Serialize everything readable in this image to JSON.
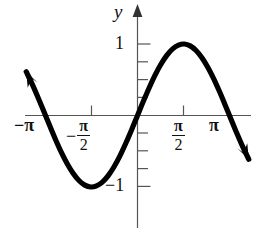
{
  "figure": {
    "kind": "math-graph",
    "axis_color": "#555555",
    "curve_color": "#000000",
    "background": "#ffffff",
    "y_axis_label": "y"
  },
  "labels": {
    "y_axis": "y",
    "y_tick_one": "1",
    "y_tick_neg_one": "−1",
    "x_tick_neg_pi": "−π",
    "x_tick_pi": "π",
    "minus_sign": "−",
    "pi_symbol": "π",
    "two": "2"
  },
  "chart_data": {
    "type": "line",
    "title": "",
    "xlabel": "",
    "ylabel": "y",
    "function": "y = sin(x)",
    "xlim": [
      -3.927,
      3.927
    ],
    "ylim": [
      -1.35,
      1.35
    ],
    "grid": false,
    "legend": null,
    "x_tick_labels": [
      "−π",
      "−π/2",
      "π/2",
      "π"
    ],
    "x_tick_values": [
      -3.14159,
      -1.5708,
      1.5708,
      3.14159
    ],
    "y_tick_labels": [
      "1",
      "−1"
    ],
    "y_tick_values": [
      1,
      -1
    ],
    "y_minor_tick_values": [
      0.75,
      0.5,
      0.25,
      -0.25,
      -0.5,
      -0.75
    ],
    "x": [
      -3.8,
      -3.6,
      -3.4,
      -3.2,
      -3.0,
      -2.8,
      -2.6,
      -2.4,
      -2.2,
      -2.0,
      -1.8,
      -1.6,
      -1.4,
      -1.2,
      -1.0,
      -0.8,
      -0.6,
      -0.4,
      -0.2,
      0.0,
      0.2,
      0.4,
      0.6,
      0.8,
      1.0,
      1.2,
      1.4,
      1.6,
      1.8,
      2.0,
      2.2,
      2.4,
      2.6,
      2.8,
      3.0,
      3.2,
      3.4,
      3.6,
      3.8
    ],
    "y": [
      0.612,
      0.443,
      0.256,
      0.058,
      -0.141,
      -0.335,
      -0.516,
      -0.675,
      -0.808,
      -0.909,
      -0.974,
      -1.0,
      -0.985,
      -0.932,
      -0.841,
      -0.717,
      -0.565,
      -0.389,
      -0.199,
      0.0,
      0.199,
      0.389,
      0.565,
      0.717,
      0.841,
      0.932,
      0.985,
      1.0,
      0.974,
      0.909,
      0.808,
      0.675,
      0.516,
      0.335,
      0.141,
      -0.058,
      -0.256,
      -0.443,
      -0.612
    ],
    "maximum": {
      "x": 1.5708,
      "y": 1
    },
    "minimum": {
      "x": -1.5708,
      "y": -1
    },
    "zeros": [
      -3.14159,
      0,
      3.14159
    ],
    "arrowheads": [
      "left-end-up",
      "right-end-down"
    ]
  }
}
